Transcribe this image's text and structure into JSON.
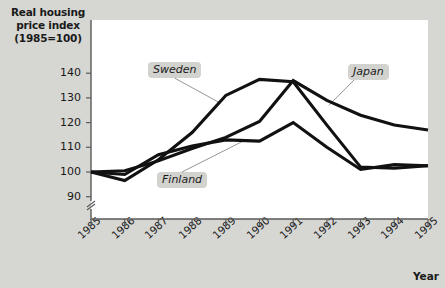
{
  "chart_data": {
    "type": "line",
    "title": "",
    "ylabel": "Real housing price index (1985=100)",
    "xlabel": "Year",
    "categories": [
      "1985",
      "1986",
      "1987",
      "1988",
      "1989",
      "1990",
      "1991",
      "1992",
      "1993",
      "1994",
      "1995"
    ],
    "yticks": [
      90,
      100,
      110,
      120,
      130,
      140
    ],
    "ylim": [
      88,
      144
    ],
    "y_axis_break": true,
    "grid": false,
    "legend_position": "inline-callouts",
    "series": [
      {
        "name": "Sweden",
        "color": "#111111",
        "values": [
          100,
          96.5,
          105,
          116,
          131,
          137.5,
          136.5,
          119,
          102,
          101.5,
          102.5
        ]
      },
      {
        "name": "Japan",
        "color": "#111111",
        "values": [
          100,
          100.5,
          104.5,
          109.5,
          114,
          120.5,
          137,
          129,
          123,
          119,
          117
        ]
      },
      {
        "name": "Finland",
        "color": "#111111",
        "values": [
          100,
          99,
          107,
          110.5,
          113,
          112.5,
          120,
          110,
          101,
          103,
          102.5
        ]
      }
    ],
    "annotations": [
      {
        "label": "Sweden",
        "x_px": 148,
        "y_px": 62
      },
      {
        "label": "Finland",
        "x_px": 157,
        "y_px": 172
      },
      {
        "label": "Japan",
        "x_px": 348,
        "y_px": 64
      }
    ]
  }
}
